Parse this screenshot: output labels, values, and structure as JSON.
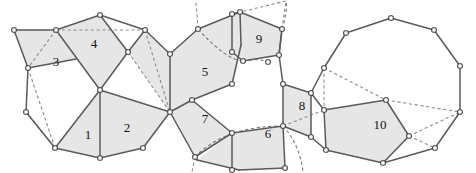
{
  "figure": {
    "width": 476,
    "height": 173,
    "background_color": "#ffffff",
    "face_fill_color": "#e6e6e6",
    "solid_edge_color": "#5a5a5a",
    "dashed_edge_color": "#8c8c8c",
    "vertex_fill_color": "#ffffff",
    "vertex_stroke_color": "#3a3a3a",
    "label_color": "#141414"
  },
  "face_labels": [
    {
      "id": "face-1",
      "text": "1",
      "x": 88,
      "y": 136
    },
    {
      "id": "face-2",
      "text": "2",
      "x": 127,
      "y": 129
    },
    {
      "id": "face-3",
      "text": "3",
      "x": 56,
      "y": 63
    },
    {
      "id": "face-4",
      "text": "4",
      "x": 94,
      "y": 45
    },
    {
      "id": "face-5",
      "text": "5",
      "x": 205,
      "y": 73
    },
    {
      "id": "face-6",
      "text": "6",
      "x": 268,
      "y": 135
    },
    {
      "id": "face-7",
      "text": "7",
      "x": 205,
      "y": 120
    },
    {
      "id": "face-8",
      "text": "8",
      "x": 302,
      "y": 107
    },
    {
      "id": "face-9",
      "text": "9",
      "x": 259,
      "y": 40
    },
    {
      "id": "face-10",
      "text": "10",
      "x": 380,
      "y": 126
    }
  ],
  "shaded_faces": [
    {
      "name": "face-3-quad",
      "points": "14,30 56,30 76,59 28,68"
    },
    {
      "name": "face-4-quad",
      "points": "56,30 100,15 128,52 100,90"
    },
    {
      "name": "face-top-right",
      "points": "128,52 145,30 170,54 170,112"
    },
    {
      "name": "face-1-tri",
      "points": "100,90 100,158 55,148"
    },
    {
      "name": "face-2-quad",
      "points": "100,90 170,112 143,148 100,158"
    },
    {
      "name": "face-5-poly",
      "points": "170,54 198,29 240,12 241,45 232,84 192,100 170,112"
    },
    {
      "name": "face-9-quad",
      "points": "232,14 240,12 282,29 279,55 243,61 232,52"
    },
    {
      "name": "face-7-tri",
      "points": "170,112 192,100 232,133 195,157"
    },
    {
      "name": "face-6-poly",
      "points": "232,133 283,126 285,168 239,170 197,160"
    },
    {
      "name": "face-8-quad",
      "points": "283,84 311,93 311,137 283,126"
    },
    {
      "name": "face-10-poly",
      "points": "324,110 386,100 409,136 383,163 326,150"
    }
  ],
  "solid_edges": [
    {
      "name": "e-left-top",
      "points": "14,30 56,30"
    },
    {
      "name": "e-left-upper",
      "points": "14,30 28,68"
    },
    {
      "name": "e-left-mid",
      "points": "28,68 26,112"
    },
    {
      "name": "e-left-lower",
      "points": "26,112 55,148"
    },
    {
      "name": "e-left-diag",
      "points": "28,68 76,59"
    },
    {
      "name": "e-3-4",
      "points": "56,30 100,90"
    },
    {
      "name": "e-4-top",
      "points": "56,30 100,15"
    },
    {
      "name": "e-4-right",
      "points": "100,15 128,52"
    },
    {
      "name": "e-4-down",
      "points": "128,52 100,90"
    },
    {
      "name": "e-top-arc1",
      "points": "100,15 145,30"
    },
    {
      "name": "e-top-arc2",
      "points": "145,30 170,54"
    },
    {
      "name": "e-128-145",
      "points": "128,52 145,30"
    },
    {
      "name": "e-1-left",
      "points": "100,90 55,148"
    },
    {
      "name": "e-1-vert",
      "points": "100,90 100,158"
    },
    {
      "name": "e-1-bottom",
      "points": "55,148 100,158"
    },
    {
      "name": "e-2-bottom",
      "points": "100,158 143,148"
    },
    {
      "name": "e-2-right",
      "points": "143,148 170,112"
    },
    {
      "name": "e-2-top",
      "points": "100,90 170,112"
    },
    {
      "name": "e-hub-up",
      "points": "170,54 170,112"
    },
    {
      "name": "e-5-ul",
      "points": "170,54 198,29"
    },
    {
      "name": "e-5-ut",
      "points": "198,29 240,12"
    },
    {
      "name": "e-5-r1",
      "points": "240,12 241,45"
    },
    {
      "name": "e-5-r2",
      "points": "241,45 232,84"
    },
    {
      "name": "e-5-br",
      "points": "232,84 192,100"
    },
    {
      "name": "e-5-bl",
      "points": "192,100 170,112"
    },
    {
      "name": "e-9-top",
      "points": "232,14 240,12"
    },
    {
      "name": "e-9-left",
      "points": "232,14 232,52"
    },
    {
      "name": "e-9-ur",
      "points": "240,12 282,29"
    },
    {
      "name": "e-9-rr",
      "points": "282,29 279,55"
    },
    {
      "name": "e-9-br",
      "points": "279,55 243,61"
    },
    {
      "name": "e-9-bl",
      "points": "243,61 232,52"
    },
    {
      "name": "e-7-l",
      "points": "170,112 195,157"
    },
    {
      "name": "e-7-b",
      "points": "195,157 232,133"
    },
    {
      "name": "e-7-t",
      "points": "192,100 232,133"
    },
    {
      "name": "e-6-t",
      "points": "232,133 283,126"
    },
    {
      "name": "e-6-r",
      "points": "283,126 285,168"
    },
    {
      "name": "e-6-b",
      "points": "285,168 239,170"
    },
    {
      "name": "e-6-l",
      "points": "239,170 197,160"
    },
    {
      "name": "e-6-ll",
      "points": "197,160 195,157"
    },
    {
      "name": "e-6-mid",
      "points": "232,133 232,170"
    },
    {
      "name": "e-8-l",
      "points": "283,84 283,126"
    },
    {
      "name": "e-8-t",
      "points": "283,84 311,93"
    },
    {
      "name": "e-8-r",
      "points": "311,93 311,137"
    },
    {
      "name": "e-8-b",
      "points": "311,137 283,126"
    },
    {
      "name": "e-8-up",
      "points": "279,55 283,84"
    },
    {
      "name": "e-8-upl",
      "points": "282,29 279,55"
    },
    {
      "name": "e-oct-ul",
      "points": "311,93 324,68"
    },
    {
      "name": "e-oct-ul2",
      "points": "324,68 346,33"
    },
    {
      "name": "e-oct-t",
      "points": "346,33 391,18"
    },
    {
      "name": "e-oct-tr",
      "points": "391,18 434,30"
    },
    {
      "name": "e-oct-r",
      "points": "434,30 460,66"
    },
    {
      "name": "e-oct-rb",
      "points": "460,66 460,112"
    },
    {
      "name": "e-oct-b",
      "points": "460,112 435,148"
    },
    {
      "name": "e-oct-bl",
      "points": "435,148 383,163"
    },
    {
      "name": "e-oct-bl2",
      "points": "383,163 326,150"
    },
    {
      "name": "e-oct-l",
      "points": "326,150 311,137"
    },
    {
      "name": "e-10-t",
      "points": "324,110 386,100"
    },
    {
      "name": "e-10-l",
      "points": "324,110 326,150"
    },
    {
      "name": "e-10-tr",
      "points": "386,100 409,136"
    },
    {
      "name": "e-10-br",
      "points": "409,136 383,163"
    },
    {
      "name": "e-oct-inner",
      "points": "311,93 324,110"
    }
  ],
  "dashed_edges": [
    {
      "name": "d-3-diag",
      "points": "56,30 28,68"
    },
    {
      "name": "d-left-v1",
      "points": "28,68 55,148"
    },
    {
      "name": "d-left-v2",
      "points": "26,112 55,148"
    },
    {
      "name": "d-top-56-145",
      "points": "56,30 145,30"
    },
    {
      "name": "d-128-170",
      "points": "128,52 170,112"
    },
    {
      "name": "d-145-170",
      "points": "145,30 170,112"
    },
    {
      "name": "d-8-324",
      "points": "283,126 324,110"
    },
    {
      "name": "d-oct-324-68",
      "points": "324,68 324,110"
    },
    {
      "name": "d-oct-346",
      "points": "324,68 386,100"
    },
    {
      "name": "d-oct-460",
      "points": "386,100 460,112"
    },
    {
      "name": "d-oct-409",
      "points": "409,136 460,112"
    },
    {
      "name": "d-oct-383",
      "points": "409,136 435,148"
    },
    {
      "name": "d-stub-198",
      "points": "198,29 196,2"
    },
    {
      "name": "d-stub-232",
      "points": "232,14 286,1"
    },
    {
      "name": "d-stub-282",
      "points": "282,29 286,1"
    },
    {
      "name": "d-stub-195",
      "points": "195,157 192,172"
    },
    {
      "name": "d-stub-285",
      "points": "285,168 289,172"
    },
    {
      "name": "d-stub-232b",
      "points": "232,170 230,172"
    }
  ],
  "dashed_arcs": [
    {
      "name": "arc-9-top",
      "d": "M 198,29 Q 226,60 243,61"
    },
    {
      "name": "arc-9-small",
      "d": "M 243,61 Q 260,58 268,62"
    },
    {
      "name": "arc-7-6",
      "d": "M 195,157 Q 225,126 283,126"
    },
    {
      "name": "arc-6-right",
      "d": "M 283,126 Q 300,145 303,172"
    },
    {
      "name": "arc-top-r",
      "d": "M 282,29 Q 288,10 286,1"
    }
  ],
  "vertices": [
    {
      "name": "v-14-30",
      "x": 14,
      "y": 30
    },
    {
      "name": "v-56-30",
      "x": 56,
      "y": 30
    },
    {
      "name": "v-28-68",
      "x": 28,
      "y": 68
    },
    {
      "name": "v-26-112",
      "x": 26,
      "y": 112
    },
    {
      "name": "v-55-148",
      "x": 55,
      "y": 148
    },
    {
      "name": "v-100-15",
      "x": 100,
      "y": 15
    },
    {
      "name": "v-128-52",
      "x": 128,
      "y": 52
    },
    {
      "name": "v-145-30",
      "x": 145,
      "y": 30
    },
    {
      "name": "v-100-90",
      "x": 100,
      "y": 90
    },
    {
      "name": "v-100-158",
      "x": 100,
      "y": 158
    },
    {
      "name": "v-143-148",
      "x": 143,
      "y": 148
    },
    {
      "name": "v-170-54",
      "x": 170,
      "y": 54
    },
    {
      "name": "v-170-112",
      "x": 170,
      "y": 112
    },
    {
      "name": "v-198-29",
      "x": 198,
      "y": 29
    },
    {
      "name": "v-240-12",
      "x": 240,
      "y": 12
    },
    {
      "name": "v-232-14",
      "x": 232,
      "y": 14
    },
    {
      "name": "v-232-52",
      "x": 232,
      "y": 52
    },
    {
      "name": "v-243-61",
      "x": 243,
      "y": 61
    },
    {
      "name": "v-268-62",
      "x": 268,
      "y": 62
    },
    {
      "name": "v-282-29",
      "x": 282,
      "y": 29
    },
    {
      "name": "v-279-55",
      "x": 279,
      "y": 55
    },
    {
      "name": "v-232-84",
      "x": 232,
      "y": 84
    },
    {
      "name": "v-192-100",
      "x": 192,
      "y": 100
    },
    {
      "name": "v-195-157",
      "x": 195,
      "y": 157
    },
    {
      "name": "v-232-133",
      "x": 232,
      "y": 133
    },
    {
      "name": "v-232-170",
      "x": 232,
      "y": 170
    },
    {
      "name": "v-283-126",
      "x": 283,
      "y": 126
    },
    {
      "name": "v-285-168",
      "x": 285,
      "y": 168
    },
    {
      "name": "v-283-84",
      "x": 283,
      "y": 84
    },
    {
      "name": "v-311-93",
      "x": 311,
      "y": 93
    },
    {
      "name": "v-311-137",
      "x": 311,
      "y": 137
    },
    {
      "name": "v-324-68",
      "x": 324,
      "y": 68
    },
    {
      "name": "v-324-110",
      "x": 324,
      "y": 110
    },
    {
      "name": "v-326-150",
      "x": 326,
      "y": 150
    },
    {
      "name": "v-346-33",
      "x": 346,
      "y": 33
    },
    {
      "name": "v-391-18",
      "x": 391,
      "y": 18
    },
    {
      "name": "v-434-30",
      "x": 434,
      "y": 30
    },
    {
      "name": "v-460-66",
      "x": 460,
      "y": 66
    },
    {
      "name": "v-460-112",
      "x": 460,
      "y": 112
    },
    {
      "name": "v-435-148",
      "x": 435,
      "y": 148
    },
    {
      "name": "v-383-163",
      "x": 383,
      "y": 163
    },
    {
      "name": "v-386-100",
      "x": 386,
      "y": 100
    },
    {
      "name": "v-409-136",
      "x": 409,
      "y": 136
    }
  ]
}
